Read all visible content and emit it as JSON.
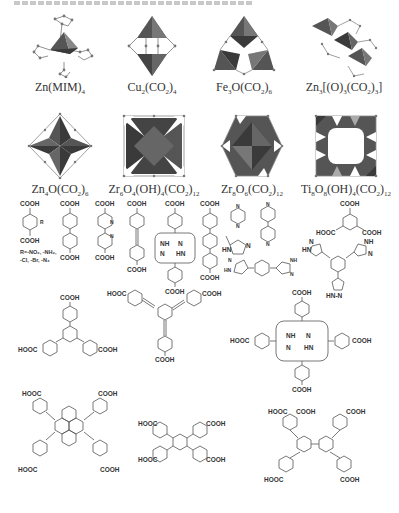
{
  "figure": {
    "caption_top": "(faint Chinese caption text, illegible)",
    "sbu_row1": [
      {
        "id": "zn-mim",
        "label_main": "Zn(MIM)",
        "label_sub": "4"
      },
      {
        "id": "cu2",
        "label_main": "Cu",
        "sub1": "2",
        "mid": "(CO",
        "sub2": "2",
        "end": ")",
        "sub3": "4"
      },
      {
        "id": "fe3o",
        "label_main": "Fe",
        "sub1": "3",
        "mid": "O(CO",
        "sub2": "2",
        "end": ")",
        "sub3": "6"
      },
      {
        "id": "zn3",
        "label_main": "Zn",
        "sub1": "3",
        "mid": "[(O)",
        "sub2": "3",
        "mid2": "(CO",
        "sub3": "2",
        "end": ")",
        "sub4": "3",
        "end2": "]"
      }
    ],
    "sbu_row2": [
      {
        "id": "zn4o",
        "label_main": "Zn",
        "sub1": "4",
        "mid": "O(CO",
        "sub2": "2",
        "end": ")",
        "sub3": "6"
      },
      {
        "id": "zr6",
        "text": "Zr6O4(OH)4(CO2)12"
      },
      {
        "id": "zr8",
        "text": "Zr8O6(CO2)12"
      },
      {
        "id": "ti8",
        "text": "Ti8O8(OH)4(CO2)12"
      }
    ],
    "labels": {
      "zn_mim": "Zn(MIM)",
      "zn_mim_sub": "4",
      "cu_a": "Cu",
      "cu_s1": "2",
      "cu_b": "(CO",
      "cu_s2": "2",
      "cu_c": ")",
      "cu_s3": "4",
      "fe_a": "Fe",
      "fe_s1": "3",
      "fe_b": "O(CO",
      "fe_s2": "2",
      "fe_c": ")",
      "fe_s3": "6",
      "zn3_a": "Zn",
      "zn3_s1": "3",
      "zn3_b": "[(O)",
      "zn3_s2": "3",
      "zn3_c": "(CO",
      "zn3_s3": "2",
      "zn3_d": ")",
      "zn3_s4": "3",
      "zn3_e": "]",
      "zn4_a": "Zn",
      "zn4_s1": "4",
      "zn4_b": "O(CO",
      "zn4_s2": "2",
      "zn4_c": ")",
      "zn4_s3": "6",
      "zr6_a": "Zr",
      "zr6_s1": "6",
      "zr6_b": "O",
      "zr6_s2": "4",
      "zr6_c": "(OH)",
      "zr6_s3": "4",
      "zr6_d": "(CO",
      "zr6_s4": "2",
      "zr6_e": ")",
      "zr6_s5": "12",
      "zr8_a": "Zr",
      "zr8_s1": "8",
      "zr8_b": "O",
      "zr8_s2": "6",
      "zr8_c": "(CO",
      "zr8_s3": "2",
      "zr8_d": ")",
      "zr8_s4": "12",
      "ti_a": "Ti",
      "ti_s1": "8",
      "ti_b": "O",
      "ti_s2": "8",
      "ti_c": "(OH)",
      "ti_s3": "4",
      "ti_d": "(CO",
      "ti_s4": "2",
      "ti_e": ")",
      "ti_s5": "12"
    },
    "chem": {
      "cooh": "COOH",
      "hooc": "HOOC",
      "r_group": "R",
      "nh": "NH",
      "hn": "HN",
      "n": "N",
      "hn_n": "HN-N",
      "r_note_line1": "R=-NO₂, -NH₂,",
      "r_note_line2": "-Cl, -Br, -N₃"
    },
    "colors": {
      "polyhedron_dark": "#3a3a3a",
      "polyhedron_mid": "#6a6a6a",
      "polyhedron_light": "#a8a8a8",
      "bond": "#555555",
      "atom": "#777777",
      "text": "#333333"
    }
  }
}
